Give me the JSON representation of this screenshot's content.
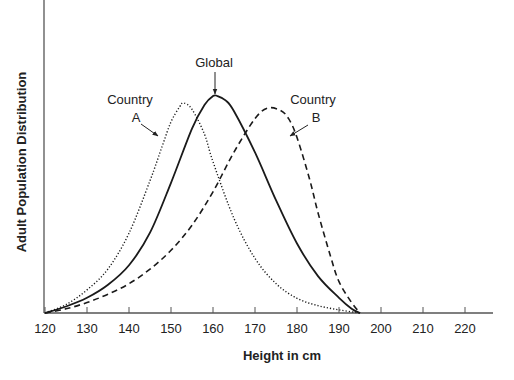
{
  "chart_data": {
    "type": "line",
    "title": "",
    "xlabel": "Height in cm",
    "ylabel": "Adult Population Distribution",
    "xlim": [
      120,
      226
    ],
    "x_ticks": [
      120,
      130,
      140,
      150,
      160,
      170,
      180,
      190,
      200,
      210,
      220
    ],
    "y_ticks": [],
    "grid": false,
    "legend": "none (inline annotations)",
    "series": [
      {
        "name": "Country A",
        "style": "dotted",
        "x": [
          120,
          125,
          130,
          135,
          140,
          145,
          148,
          150,
          152,
          153,
          155,
          158,
          160,
          165,
          170,
          175,
          180,
          185,
          190,
          195
        ],
        "values": [
          0,
          0.04,
          0.11,
          0.21,
          0.38,
          0.63,
          0.8,
          0.91,
          0.98,
          1.0,
          0.97,
          0.85,
          0.72,
          0.45,
          0.26,
          0.14,
          0.07,
          0.035,
          0.015,
          0
        ]
      },
      {
        "name": "Global",
        "style": "solid",
        "x": [
          120,
          125,
          130,
          135,
          140,
          145,
          150,
          155,
          158,
          160,
          161,
          163,
          165,
          170,
          175,
          180,
          185,
          190,
          193,
          195
        ],
        "values": [
          0,
          0.03,
          0.07,
          0.13,
          0.22,
          0.37,
          0.6,
          0.85,
          0.96,
          1.0,
          1.0,
          0.98,
          0.93,
          0.74,
          0.52,
          0.32,
          0.17,
          0.07,
          0.02,
          0
        ]
      },
      {
        "name": "Country B",
        "style": "dashed",
        "x": [
          120,
          125,
          130,
          135,
          140,
          145,
          150,
          155,
          160,
          165,
          170,
          173,
          176,
          178,
          180,
          183,
          185,
          188,
          190,
          193,
          195
        ],
        "values": [
          0,
          0.02,
          0.05,
          0.09,
          0.14,
          0.21,
          0.3,
          0.42,
          0.58,
          0.77,
          0.93,
          0.98,
          0.97,
          0.93,
          0.84,
          0.64,
          0.48,
          0.27,
          0.15,
          0.05,
          0
        ]
      }
    ],
    "annotations": [
      {
        "text_lines": [
          "Country",
          "A"
        ],
        "points_to": "Country A"
      },
      {
        "text_lines": [
          "Global"
        ],
        "points_to": "Global"
      },
      {
        "text_lines": [
          "Country",
          "B"
        ],
        "points_to": "Country B"
      }
    ],
    "peak_heights_px_ref": {
      "Country A": 103,
      "Global": 96,
      "Country B": 104
    }
  },
  "labels": {
    "xlabel": "Height in cm",
    "ylabel": "Adult Population Distribution",
    "ann_a_1": "Country",
    "ann_a_2": "A",
    "ann_global": "Global",
    "ann_b_1": "Country",
    "ann_b_2": "B"
  },
  "colors": {
    "line": "#1a1a1a",
    "axis": "#555555",
    "text": "#222222"
  }
}
